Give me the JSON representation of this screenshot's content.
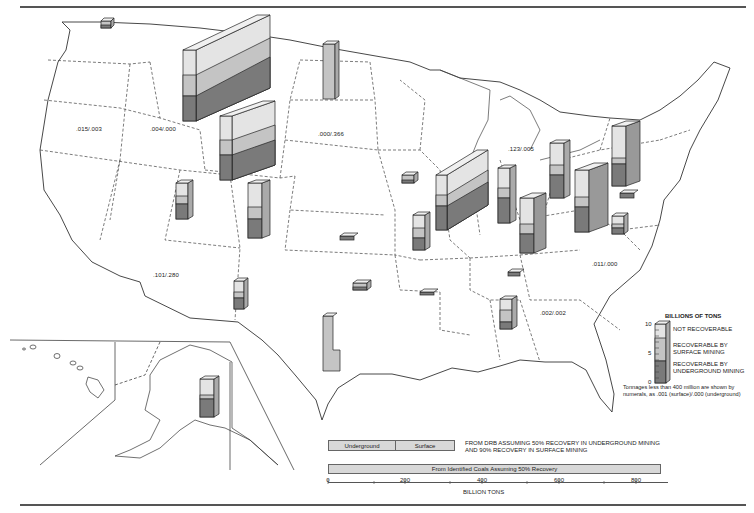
{
  "map": {
    "title_visible": false,
    "state_labels": [
      {
        "id": "washington",
        "text": ".015/.003",
        "x": 76,
        "y": 126
      },
      {
        "id": "idaho",
        "text": ".004/.000",
        "x": 150,
        "y": 126
      },
      {
        "id": "south-dakota",
        "text": ".000/.366",
        "x": 318,
        "y": 131
      },
      {
        "id": "michigan",
        "text": ".123/.005",
        "x": 508,
        "y": 146
      },
      {
        "id": "arizona",
        "text": ".101/.280",
        "x": 153,
        "y": 272
      },
      {
        "id": "north-carolina",
        "text": ".011/.000",
        "x": 592,
        "y": 261
      },
      {
        "id": "georgia",
        "text": ".002/.002",
        "x": 540,
        "y": 310
      }
    ]
  },
  "legend": {
    "title": "BILLIONS OF TONS",
    "ticks": [
      "10",
      "5",
      "0"
    ],
    "items": [
      {
        "label": "NOT RECOVERABLE",
        "color": "#e4e4e4"
      },
      {
        "label": "RECOVERABLE BY\nSURFACE MINING",
        "color": "#c4c4c4"
      },
      {
        "label": "RECOVERABLE BY\nUNDERGROUND MINING",
        "color": "#7a7a7a"
      }
    ],
    "note_line1": "Tonnages less than 400 million are shown by",
    "note_line2": "numerals, as .001 (surface)/.000 (underground)"
  },
  "summary": {
    "bar1": {
      "segments": [
        {
          "label": "Underground"
        },
        {
          "label": "Surface"
        }
      ],
      "note_line1": "FROM DRB ASSUMING 50% RECOVERY IN UNDERGROUND MINING",
      "note_line2": "AND 90% RECOVERY IN SURFACE MINING"
    },
    "bar2": {
      "label": "From Identified Coals Assuming 50% Recovery"
    },
    "axis": {
      "ticks": [
        "0",
        "200",
        "400",
        "600",
        "800"
      ],
      "label": "BILLION TONS"
    }
  },
  "colors": {
    "not_recoverable": "#e4e4e4",
    "surface": "#c4c4c4",
    "underground": "#7a7a7a",
    "outline": "#333333"
  }
}
